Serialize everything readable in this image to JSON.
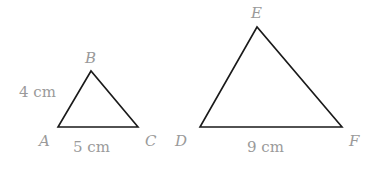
{
  "diagram": {
    "triangles": [
      {
        "name": "ABC",
        "vertices": {
          "A": {
            "label": "A",
            "x": 58,
            "y": 127
          },
          "B": {
            "label": "B",
            "x": 91,
            "y": 71
          },
          "C": {
            "label": "C",
            "x": 138,
            "y": 127
          }
        },
        "measurements": {
          "AB": "4 cm",
          "AC": "5 cm"
        }
      },
      {
        "name": "DEF",
        "vertices": {
          "D": {
            "label": "D",
            "x": 200,
            "y": 127
          },
          "E": {
            "label": "E",
            "x": 257,
            "y": 27
          },
          "F": {
            "label": "F",
            "x": 342,
            "y": 127
          }
        },
        "measurements": {
          "DF": "9 cm"
        }
      }
    ],
    "colors": {
      "edge": "#1a1a1a",
      "label": "#9a9a9a",
      "background": "#ffffff"
    }
  }
}
